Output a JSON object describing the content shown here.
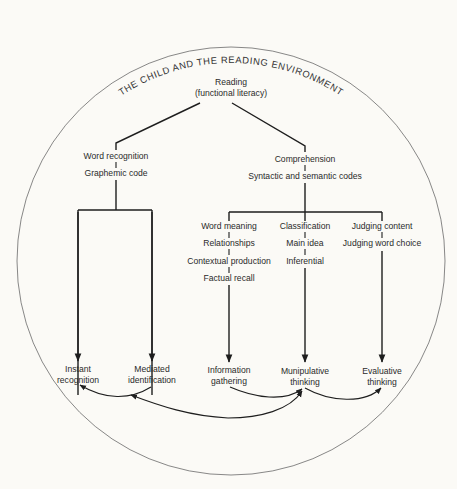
{
  "title": "THE CHILD AND THE READING ENVIRONMENT",
  "root": {
    "line1": "Reading",
    "line2": "(functional literacy)"
  },
  "branches": {
    "word_recognition": {
      "label": "Word recognition",
      "sub": "Graphemic code",
      "outcomes": [
        {
          "line1": "Instant",
          "line2": "recognition"
        },
        {
          "line1": "Mediated",
          "line2": "identification"
        }
      ]
    },
    "comprehension": {
      "label": "Comprehension",
      "sub": "Syntactic and semantic codes",
      "columns": [
        {
          "items": [
            "Word meaning",
            "Relationships",
            "Contextual production",
            "Factual recall"
          ],
          "outcome": {
            "line1": "Information",
            "line2": "gathering"
          }
        },
        {
          "items": [
            "Classification",
            "Main idea",
            "Inferential"
          ],
          "outcome": {
            "line1": "Munipulative",
            "line2": "thinking"
          }
        },
        {
          "items": [
            "Judging content",
            "Judging word choice"
          ],
          "outcome": {
            "line1": "Evaluative",
            "line2": "thinking"
          }
        }
      ]
    }
  },
  "relationships": [
    {
      "from": "Mediated identification",
      "to": "Instant recognition"
    },
    {
      "from": "Munipulative thinking",
      "to": "Mediated identification"
    },
    {
      "from": "Information gathering",
      "to": "Munipulative thinking"
    },
    {
      "from": "Mediated identification",
      "to": "Munipulative thinking"
    },
    {
      "from": "Munipulative thinking",
      "to": "Evaluative thinking"
    }
  ],
  "colors": {
    "background": "#fbfaf6",
    "ink": "#1e1e1e",
    "circle": "#6a6a6a"
  }
}
